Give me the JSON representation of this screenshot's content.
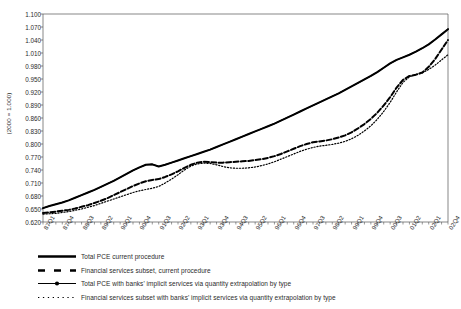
{
  "chart_data": {
    "type": "line",
    "title": "",
    "xlabel": "",
    "ylabel": "(2000 = 1.000)",
    "ylim": [
      0.62,
      1.1
    ],
    "ytick_labels": [
      "1.100",
      "1.070",
      "1.040",
      "1.010",
      "0.980",
      "0.950",
      "0.920",
      "0.890",
      "0.860",
      "0.830",
      "0.800",
      "0.770",
      "0.740",
      "0.710",
      "0.680",
      "0.650",
      "0.620"
    ],
    "ytick_values": [
      1.1,
      1.07,
      1.04,
      1.01,
      0.98,
      0.95,
      0.92,
      0.89,
      0.86,
      0.83,
      0.8,
      0.77,
      0.74,
      0.71,
      0.68,
      0.65,
      0.62
    ],
    "grid": false,
    "legend_position": "below",
    "xtick_labels": [
      "87Q1",
      "87Q4",
      "88Q3",
      "89Q2",
      "90Q1",
      "90Q4",
      "91Q3",
      "92Q2",
      "93Q1",
      "93Q4",
      "94Q3",
      "95Q2",
      "96Q1",
      "96Q4",
      "97Q3",
      "98Q2",
      "99Q1",
      "99Q4",
      "00Q3",
      "01Q2",
      "02Q1",
      "02Q4"
    ],
    "x": [
      "87Q1",
      "87Q2",
      "87Q3",
      "87Q4",
      "88Q1",
      "88Q2",
      "88Q3",
      "88Q4",
      "89Q1",
      "89Q2",
      "89Q3",
      "89Q4",
      "90Q1",
      "90Q2",
      "90Q3",
      "90Q4",
      "91Q1",
      "91Q2",
      "91Q3",
      "91Q4",
      "92Q1",
      "92Q2",
      "92Q3",
      "92Q4",
      "93Q1",
      "93Q2",
      "93Q3",
      "93Q4",
      "94Q1",
      "94Q2",
      "94Q3",
      "94Q4",
      "95Q1",
      "95Q2",
      "95Q3",
      "95Q4",
      "96Q1",
      "96Q2",
      "96Q3",
      "96Q4",
      "97Q1",
      "97Q2",
      "97Q3",
      "97Q4",
      "98Q1",
      "98Q2",
      "98Q3",
      "98Q4",
      "99Q1",
      "99Q2",
      "99Q3",
      "99Q4",
      "00Q1",
      "00Q2",
      "00Q3",
      "00Q4",
      "01Q1",
      "01Q2",
      "01Q3",
      "01Q4",
      "02Q1",
      "02Q2",
      "02Q3",
      "02Q4"
    ],
    "series": [
      {
        "name": "Total PCE current procedure",
        "style": "solid-thick",
        "values": [
          0.652,
          0.657,
          0.661,
          0.665,
          0.67,
          0.676,
          0.682,
          0.688,
          0.694,
          0.701,
          0.708,
          0.715,
          0.723,
          0.731,
          0.739,
          0.746,
          0.752,
          0.753,
          0.748,
          0.752,
          0.757,
          0.762,
          0.767,
          0.772,
          0.777,
          0.782,
          0.787,
          0.793,
          0.799,
          0.805,
          0.811,
          0.817,
          0.823,
          0.829,
          0.835,
          0.841,
          0.847,
          0.854,
          0.861,
          0.868,
          0.875,
          0.882,
          0.889,
          0.896,
          0.903,
          0.91,
          0.917,
          0.925,
          0.933,
          0.941,
          0.949,
          0.957,
          0.966,
          0.976,
          0.986,
          0.994,
          1.0,
          1.006,
          1.013,
          1.021,
          1.03,
          1.041,
          1.053,
          1.065
        ]
      },
      {
        "name": "Financial services subset, current procedure",
        "style": "dashed-thick",
        "values": [
          0.641,
          0.642,
          0.644,
          0.646,
          0.648,
          0.651,
          0.655,
          0.659,
          0.664,
          0.669,
          0.675,
          0.682,
          0.689,
          0.696,
          0.703,
          0.709,
          0.714,
          0.717,
          0.719,
          0.724,
          0.73,
          0.737,
          0.745,
          0.752,
          0.757,
          0.759,
          0.758,
          0.757,
          0.757,
          0.758,
          0.759,
          0.76,
          0.761,
          0.763,
          0.765,
          0.768,
          0.772,
          0.777,
          0.783,
          0.789,
          0.795,
          0.8,
          0.804,
          0.806,
          0.808,
          0.811,
          0.815,
          0.82,
          0.827,
          0.836,
          0.846,
          0.858,
          0.872,
          0.889,
          0.908,
          0.93,
          0.948,
          0.957,
          0.96,
          0.965,
          0.978,
          0.996,
          1.018,
          1.04
        ]
      },
      {
        "name": "Total PCE with  banks' implicit services via quantity extrapolation by type",
        "style": "solid-marker",
        "values": [
          0.652,
          0.657,
          0.661,
          0.665,
          0.67,
          0.676,
          0.682,
          0.688,
          0.694,
          0.701,
          0.708,
          0.715,
          0.723,
          0.731,
          0.739,
          0.746,
          0.752,
          0.753,
          0.748,
          0.752,
          0.757,
          0.762,
          0.767,
          0.772,
          0.777,
          0.782,
          0.787,
          0.793,
          0.799,
          0.805,
          0.811,
          0.817,
          0.823,
          0.829,
          0.835,
          0.841,
          0.847,
          0.854,
          0.861,
          0.868,
          0.875,
          0.882,
          0.889,
          0.896,
          0.903,
          0.91,
          0.917,
          0.925,
          0.933,
          0.941,
          0.949,
          0.957,
          0.966,
          0.976,
          0.986,
          0.994,
          1.0,
          1.006,
          1.013,
          1.021,
          1.03,
          1.041,
          1.053,
          1.065
        ]
      },
      {
        "name": "Financial services subset with banks' implicit services via quantity extrapolation by type",
        "style": "dotted",
        "values": [
          0.638,
          0.639,
          0.64,
          0.642,
          0.644,
          0.647,
          0.65,
          0.654,
          0.658,
          0.663,
          0.668,
          0.673,
          0.678,
          0.683,
          0.688,
          0.692,
          0.695,
          0.698,
          0.702,
          0.71,
          0.719,
          0.729,
          0.74,
          0.749,
          0.754,
          0.756,
          0.755,
          0.752,
          0.748,
          0.745,
          0.744,
          0.744,
          0.745,
          0.747,
          0.75,
          0.754,
          0.759,
          0.765,
          0.771,
          0.777,
          0.783,
          0.788,
          0.792,
          0.795,
          0.797,
          0.799,
          0.802,
          0.806,
          0.812,
          0.82,
          0.83,
          0.842,
          0.857,
          0.875,
          0.896,
          0.92,
          0.942,
          0.955,
          0.96,
          0.964,
          0.972,
          0.982,
          0.994,
          1.006
        ]
      }
    ]
  },
  "yaxis": {
    "title": "(2000 = 1.000)"
  },
  "legend": {
    "items": [
      {
        "label": "Total PCE current procedure",
        "marker": "solid-thick-line-marker"
      },
      {
        "label": "Financial services subset, current procedure",
        "marker": "dashed-line-marker"
      },
      {
        "label": "Total PCE with  banks' implicit services via quantity extrapolation by type",
        "marker": "line-with-point-marker"
      },
      {
        "label": "Financial services subset with banks' implicit services via quantity extrapolation by type",
        "marker": "dotted-line-marker"
      }
    ]
  }
}
